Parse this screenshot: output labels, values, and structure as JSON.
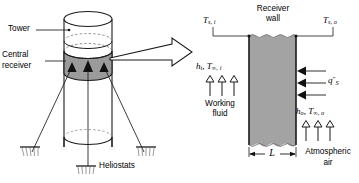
{
  "figure": {
    "left_panel": {
      "name": "tower-and-heliostat-field",
      "labels": {
        "tower": "Tower",
        "central_receiver_line1": "Central",
        "central_receiver_line2": "receiver",
        "heliostats": "Heliostats"
      },
      "colors": {
        "receiver_band": "#9b9b9b",
        "outline": "#1a1a1a"
      }
    },
    "transition_arrow": {
      "name": "expansion-arrow",
      "direction": "right"
    },
    "right_panel": {
      "name": "receiver-wall-detail",
      "labels": {
        "receiver_wall_line1": "Receiver",
        "receiver_wall_line2": "wall",
        "surface_temp_inner": "T",
        "surface_temp_inner_sub": "s, i",
        "surface_temp_outer": "T",
        "surface_temp_outer_sub": "s, o",
        "inner_coeff": "h",
        "inner_coeff_sub": "i",
        "inner_fluid_temp": "T",
        "inner_fluid_temp_sub": "∞, i",
        "outer_coeff": "h",
        "outer_coeff_sub": "o",
        "outer_fluid_temp": "T",
        "outer_fluid_temp_sub": "∞, o",
        "solar_flux": "q",
        "solar_flux_prime": "″",
        "solar_flux_sub": "S",
        "working_fluid_line1": "Working",
        "working_fluid_line2": "fluid",
        "atmospheric_air_line1": "Atmospheric",
        "atmospheric_air_line2": "air",
        "thickness": "L"
      },
      "colors": {
        "wall_fill": "#a3a3a3",
        "outline": "#1a1a1a"
      },
      "counts": {
        "inner_convection_arrows": 3,
        "outer_convection_arrows": 3,
        "solar_flux_arrows": 3
      }
    }
  }
}
